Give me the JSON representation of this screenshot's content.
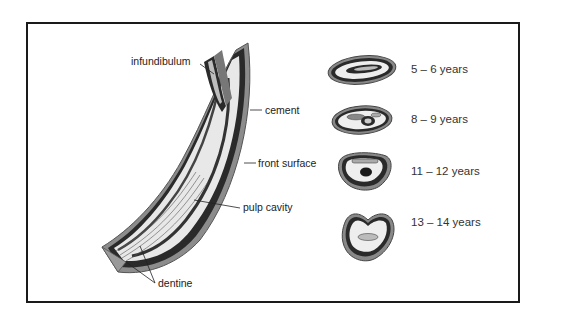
{
  "diagram": {
    "labels": {
      "infundibulum": "infundibulum",
      "cement": "cement",
      "front_surface": "front surface",
      "pulp_cavity": "pulp cavity",
      "dentine": "dentine"
    },
    "cross_sections": [
      {
        "age": "5 – 6 years"
      },
      {
        "age": "8 – 9 years"
      },
      {
        "age": "11 – 12 years"
      },
      {
        "age": "13 – 14 years"
      }
    ],
    "colors": {
      "frame": "#1a1a1a",
      "enamel_dark": "#2a2a2a",
      "cement_gray": "#8a8a8a",
      "dentine_light": "#e6e6e6",
      "text": "#222222"
    }
  }
}
